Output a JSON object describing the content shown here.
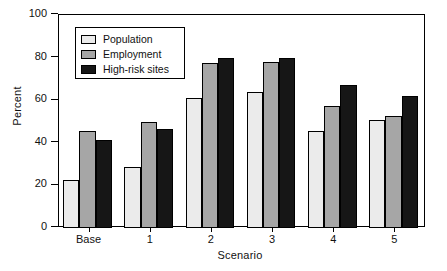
{
  "chart_data": {
    "type": "bar",
    "title": "",
    "xlabel": "Scenario",
    "ylabel": "Percent",
    "categories": [
      "Base",
      "1",
      "2",
      "3",
      "4",
      "5"
    ],
    "series": [
      {
        "name": "Population",
        "values": [
          22.5,
          28.5,
          61.0,
          64.0,
          45.5,
          50.5
        ],
        "color": "#ebebeb"
      },
      {
        "name": "Employment",
        "values": [
          45.5,
          50.0,
          77.5,
          78.0,
          57.5,
          52.5
        ],
        "color": "#a6a6a6"
      },
      {
        "name": "High-risk sites",
        "values": [
          41.5,
          46.5,
          80.0,
          80.0,
          67.0,
          62.0
        ],
        "color": "#161616"
      }
    ],
    "ylim": [
      0,
      100
    ],
    "yticks": [
      0,
      20,
      40,
      60,
      80,
      100
    ],
    "ytick_labels": [
      "0",
      "20",
      "40",
      "60",
      "80",
      "100"
    ],
    "grid": false,
    "legend_position": "upper-left",
    "legend_entries": [
      "Population",
      "Employment",
      "High-risk sites"
    ]
  }
}
